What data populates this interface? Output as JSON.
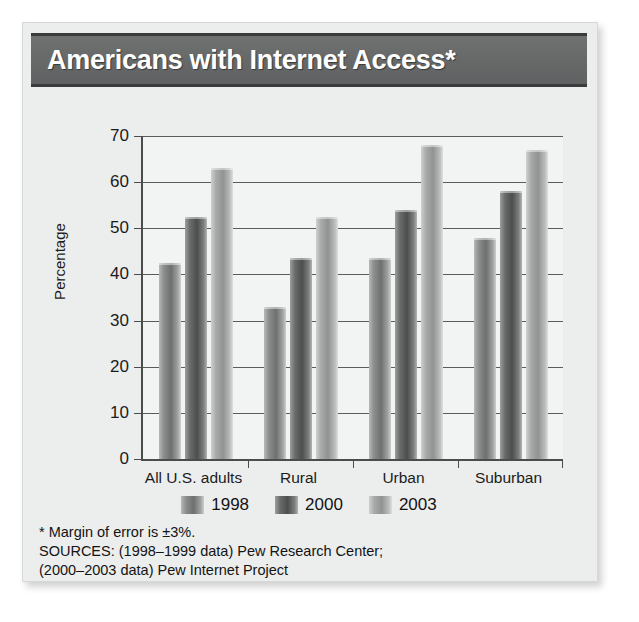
{
  "chart_data": {
    "type": "bar",
    "title": "Americans with Internet Access*",
    "xlabel": "",
    "ylabel": "Percentage",
    "ylim": [
      0,
      70
    ],
    "yticks": [
      70,
      60,
      50,
      40,
      30,
      20,
      10,
      0
    ],
    "grid": true,
    "legend_position": "bottom",
    "categories": [
      "All U.S. adults",
      "Rural",
      "Urban",
      "Suburban"
    ],
    "series": [
      {
        "name": "1998",
        "color": "#7e8080",
        "values": [
          42.5,
          33,
          43.5,
          48
        ]
      },
      {
        "name": "2000",
        "color": "#5a5c5c",
        "values": [
          52.5,
          43.5,
          54,
          58
        ]
      },
      {
        "name": "2003",
        "color": "#a5a7a7",
        "values": [
          63,
          52.5,
          68,
          67
        ]
      }
    ],
    "annotations": [
      "* Margin of error is ±3%.",
      "SOURCES: (1998–1999 data) Pew Research Center;",
      "(2000–2003 data) Pew Internet Project"
    ]
  },
  "colors": {
    "title_band": "#676969",
    "card_background": "#eceded",
    "plot_background": "#f2f3f3",
    "axis": "#4b4d4d"
  }
}
